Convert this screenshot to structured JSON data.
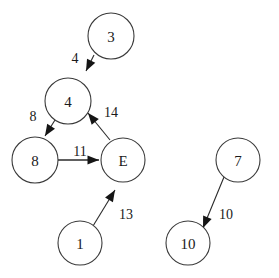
{
  "diagram": {
    "type": "directed-weighted-graph",
    "colors": {
      "background": "#ffffff",
      "node_fill": "#ffffff",
      "node_stroke": "#3a3a3a",
      "edge_stroke": "#2b2b2b",
      "arrow_fill": "#151515",
      "text": "#1a1a1a"
    },
    "nodes": [
      {
        "id": "n3",
        "label": "3",
        "cx": 111,
        "cy": 36,
        "r": 23
      },
      {
        "id": "n4",
        "label": "4",
        "cx": 68,
        "cy": 101,
        "r": 23
      },
      {
        "id": "n8",
        "label": "8",
        "cx": 35,
        "cy": 160,
        "r": 23
      },
      {
        "id": "nE",
        "label": "E",
        "cx": 123,
        "cy": 160,
        "r": 22
      },
      {
        "id": "n1",
        "label": "1",
        "cx": 80,
        "cy": 243,
        "r": 22
      },
      {
        "id": "n7",
        "label": "7",
        "cx": 238,
        "cy": 160,
        "r": 22
      },
      {
        "id": "n10",
        "label": "10",
        "cx": 188,
        "cy": 243,
        "r": 22
      }
    ],
    "edges": [
      {
        "id": "e3_4",
        "from": "3",
        "to": "4",
        "weight": "4",
        "label_x": 75,
        "label_y": 58,
        "x1": 94,
        "y1": 55,
        "x2": 86,
        "y2": 71,
        "thick": false
      },
      {
        "id": "e4_8",
        "from": "4",
        "to": "8",
        "weight": "8",
        "label_x": 33,
        "label_y": 116,
        "x1": 55,
        "y1": 120,
        "x2": 45,
        "y2": 136,
        "thick": false
      },
      {
        "id": "e8_E",
        "from": "8",
        "to": "E",
        "weight": "11",
        "label_x": 80,
        "label_y": 151,
        "x1": 58,
        "y1": 160,
        "x2": 99,
        "y2": 160,
        "thick": true
      },
      {
        "id": "eE_4",
        "from": "E",
        "to": "4",
        "weight": "14",
        "label_x": 111,
        "label_y": 112,
        "x1": 110,
        "y1": 140,
        "x2": 88,
        "y2": 113,
        "thick": false
      },
      {
        "id": "e1_E",
        "from": "1",
        "to": "E",
        "weight": "13",
        "label_x": 126,
        "label_y": 214,
        "x1": 93,
        "y1": 226,
        "x2": 115,
        "y2": 190,
        "thick": false
      },
      {
        "id": "e7_10",
        "from": "7",
        "to": "10",
        "weight": "10",
        "label_x": 226,
        "label_y": 214,
        "x1": 224,
        "y1": 177,
        "x2": 203,
        "y2": 228,
        "thick": false
      }
    ]
  }
}
